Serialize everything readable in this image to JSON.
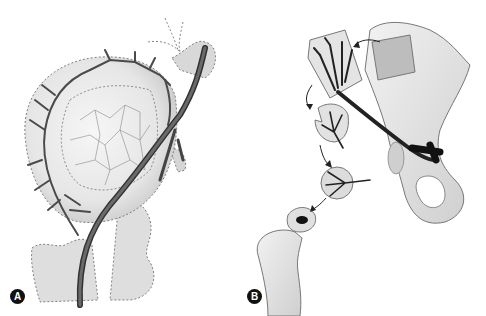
{
  "figure": {
    "panels": [
      {
        "label": "A",
        "description": "Hip joint with vascular supply to femoral head"
      },
      {
        "label": "B",
        "description": "Vascularized bone graft harvested from pelvis and transferred to femoral head"
      }
    ]
  },
  "colors": {
    "vessel": "#4a4a4a",
    "bone": "#e2e2e2",
    "bone_shade": "#c8c8c8",
    "outline": "#555555"
  }
}
